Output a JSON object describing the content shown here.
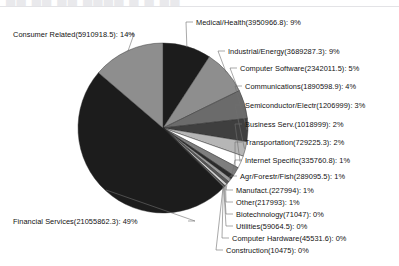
{
  "header": {
    "ghost_text": "██ ██ ██ ████ █ █ ██",
    "note": "partially cropped text row at top of screenshot"
  },
  "chart_data": {
    "type": "pie",
    "title": "",
    "subtitle": "",
    "xlabel": "",
    "ylabel": "",
    "legend_position": "callout-labels",
    "grid": false,
    "total": 43243809.2,
    "value_format": "Name(value): percent",
    "categories": [
      "Medical/Health",
      "Industrial/Energy",
      "Computer Software",
      "Communications",
      "Semiconductor/Electr",
      "Business Serv.",
      "Transportation",
      "Internet Specific",
      "Agr/Forestr/Fish",
      "Manufact.",
      "Other",
      "Biotechnology",
      "Utilities",
      "Computer Hardware",
      "Construction",
      "Financial Services",
      "Consumer Related"
    ],
    "values": [
      3950966.8,
      3689287.3,
      2342011.5,
      1890598.9,
      1206999,
      1018999,
      729225.3,
      335760.8,
      289095.5,
      227994,
      217993,
      71047,
      59064.5,
      45531.6,
      10475,
      21055862.3,
      5910918.5
    ],
    "percents": [
      9,
      9,
      5,
      4,
      3,
      2,
      2,
      1,
      1,
      1,
      1,
      0,
      0,
      0,
      0,
      49,
      14
    ],
    "colors": [
      "#1c1c1c",
      "#8e8e8e",
      "#6b6b6b",
      "#3f3f3f",
      "#b6b6b6",
      "#ffffff",
      "#7e7e7e",
      "#2b2b2b",
      "#9c9c9c",
      "#585858",
      "#d0d0d0",
      "#343434",
      "#8a8a8a",
      "#c4c4c4",
      "#6f6f6f",
      "#1c1c1c",
      "#8e8e8e"
    ],
    "slices": [
      {
        "label": "Medical/Health(3950966.8): 9%",
        "name": "Medical/Health",
        "value": 3950966.8,
        "percent": 9,
        "color": "#1c1c1c"
      },
      {
        "label": "Industrial/Energy(3689287.3): 9%",
        "name": "Industrial/Energy",
        "value": 3689287.3,
        "percent": 9,
        "color": "#8e8e8e"
      },
      {
        "label": "Computer Software(2342011.5): 5%",
        "name": "Computer Software",
        "value": 2342011.5,
        "percent": 5,
        "color": "#6b6b6b"
      },
      {
        "label": "Communications(1890598.9): 4%",
        "name": "Communications",
        "value": 1890598.9,
        "percent": 4,
        "color": "#3f3f3f"
      },
      {
        "label": "Semiconductor/Electr(1206999): 3%",
        "name": "Semiconductor/Electr",
        "value": 1206999,
        "percent": 3,
        "color": "#b6b6b6"
      },
      {
        "label": "Business Serv.(1018999): 2%",
        "name": "Business Serv.",
        "value": 1018999,
        "percent": 2,
        "color": "#ffffff"
      },
      {
        "label": "Transportation(729225.3): 2%",
        "name": "Transportation",
        "value": 729225.3,
        "percent": 2,
        "color": "#7e7e7e"
      },
      {
        "label": "Internet Specific(335760.8): 1%",
        "name": "Internet Specific",
        "value": 335760.8,
        "percent": 1,
        "color": "#2b2b2b"
      },
      {
        "label": "Agr/Forestr/Fish(289095.5): 1%",
        "name": "Agr/Forestr/Fish",
        "value": 289095.5,
        "percent": 1,
        "color": "#9c9c9c"
      },
      {
        "label": "Manufact.(227994): 1%",
        "name": "Manufact.",
        "value": 227994,
        "percent": 1,
        "color": "#585858"
      },
      {
        "label": "Other(217993): 1%",
        "name": "Other",
        "value": 217993,
        "percent": 1,
        "color": "#d0d0d0"
      },
      {
        "label": "Biotechnology(71047): 0%",
        "name": "Biotechnology",
        "value": 71047,
        "percent": 0,
        "color": "#343434"
      },
      {
        "label": "Utilities(59064.5): 0%",
        "name": "Utilities",
        "value": 59064.5,
        "percent": 0,
        "color": "#8a8a8a"
      },
      {
        "label": "Computer Hardware(45531.6): 0%",
        "name": "Computer Hardware",
        "value": 45531.6,
        "percent": 0,
        "color": "#c4c4c4"
      },
      {
        "label": "Construction(10475): 0%",
        "name": "Construction",
        "value": 10475,
        "percent": 0,
        "color": "#6f6f6f"
      },
      {
        "label": "Financial Services(21055862.3): 49%",
        "name": "Financial Services",
        "value": 21055862.3,
        "percent": 49,
        "color": "#1c1c1c"
      },
      {
        "label": "Consumer Related(5910918.5): 14%",
        "name": "Consumer Related",
        "value": 5910918.5,
        "percent": 14,
        "color": "#8e8e8e"
      }
    ]
  },
  "labels": {
    "medical_health": "Medical/Health(3950966.8): 9%",
    "industrial_energy": "Industrial/Energy(3689287.3): 9%",
    "computer_software": "Computer Software(2342011.5): 5%",
    "communications": "Communications(1890598.9): 4%",
    "semiconductor": "Semiconductor/Electr(1206999): 3%",
    "business_serv": "Business Serv.(1018999): 2%",
    "transportation": "Transportation(729225.3): 2%",
    "internet_specific": "Internet Specific(335760.8): 1%",
    "agr_forestr_fish": "Agr/Forestr/Fish(289095.5): 1%",
    "manufact": "Manufact.(227994): 1%",
    "other": "Other(217993): 1%",
    "biotechnology": "Biotechnology(71047): 0%",
    "utilities": "Utilities(59064.5): 0%",
    "computer_hardware": "Computer Hardware(45531.6): 0%",
    "construction": "Construction(10475): 0%",
    "financial_services": "Financial Services(21055862.3): 49%",
    "consumer_related": "Consumer Related(5910918.5): 14%"
  }
}
